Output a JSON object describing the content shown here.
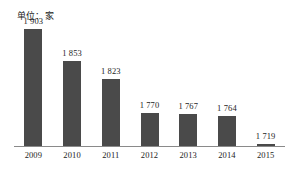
{
  "unit_label": "单位：家",
  "colors": {
    "bar_fill": "#4a4a4a",
    "axis_line": "#8a8a8a",
    "text": "#1d1d1d",
    "background": "#ffffff"
  },
  "chart_data": {
    "type": "bar",
    "title": "",
    "subtitle": "",
    "xlabel": "",
    "ylabel": "单位：家",
    "categories": [
      "2009",
      "2010",
      "2011",
      "2012",
      "2013",
      "2014",
      "2015"
    ],
    "values": [
      1903,
      1853,
      1823,
      1770,
      1767,
      1764,
      1719
    ],
    "value_labels": [
      "1 903",
      "1 853",
      "1 823",
      "1 770",
      "1 767",
      "1 764",
      "1 719"
    ],
    "tick_labels": [
      "2009",
      "2010",
      "2011",
      "2012",
      "2013",
      "2014",
      "2015"
    ],
    "ylim": [
      1715,
      1910
    ],
    "axis_baseline_value": 1715,
    "grid": false,
    "legend": null,
    "legend_position": "none",
    "orientation": "vertical",
    "series": [
      {
        "name": "数量",
        "values": [
          1903,
          1853,
          1823,
          1770,
          1767,
          1764,
          1719
        ]
      }
    ]
  }
}
